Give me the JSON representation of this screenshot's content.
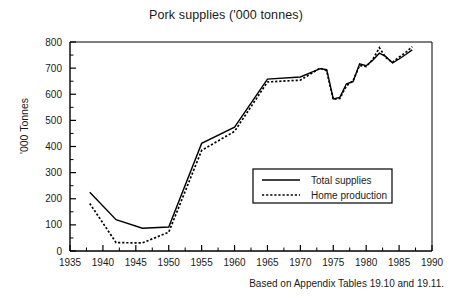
{
  "chart_data": {
    "type": "line",
    "title": "Pork supplies ('000 tonnes)",
    "xlabel": "",
    "ylabel": "'000 Tonnes",
    "xlim": [
      1935,
      1990
    ],
    "ylim": [
      0,
      800
    ],
    "xticks": [
      1935,
      1940,
      1945,
      1950,
      1955,
      1960,
      1965,
      1970,
      1975,
      1980,
      1985,
      1990
    ],
    "yticks": [
      0,
      100,
      200,
      300,
      400,
      500,
      600,
      700,
      800
    ],
    "xtick_labels": [
      "1935",
      "1940",
      "1945",
      "1950",
      "1955",
      "1960",
      "1965",
      "1970",
      "1975",
      "1980",
      "1985",
      "1990"
    ],
    "ytick_labels": [
      "0",
      "100",
      "200",
      "300",
      "400",
      "500",
      "600",
      "700",
      "800"
    ],
    "grid": false,
    "legend_position": "center-right",
    "annotation": "Based on Appendix Tables 19.10 and 19.11.",
    "x": [
      1938,
      1942,
      1946,
      1950,
      1955,
      1960,
      1965,
      1970,
      1973,
      1974,
      1975,
      1976,
      1977,
      1978,
      1979,
      1980,
      1981,
      1982,
      1983,
      1984,
      1985,
      1986,
      1987
    ],
    "series": [
      {
        "name": "Total supplies",
        "style": "solid",
        "color": "#000000",
        "values": [
          225,
          120,
          87,
          92,
          412,
          474,
          658,
          666,
          698,
          694,
          582,
          588,
          640,
          648,
          716,
          709,
          730,
          757,
          744,
          720,
          735,
          752,
          770
        ]
      },
      {
        "name": "Home production",
        "style": "dotted",
        "color": "#000000",
        "values": [
          182,
          32,
          31,
          72,
          385,
          458,
          647,
          654,
          700,
          690,
          580,
          584,
          632,
          652,
          710,
          706,
          733,
          778,
          740,
          722,
          742,
          760,
          782
        ]
      }
    ]
  },
  "legend": {
    "items": [
      {
        "label": "Total supplies",
        "style": "solid"
      },
      {
        "label": "Home production",
        "style": "dotted"
      }
    ]
  },
  "footer": {
    "note": "Based on Appendix Tables 19.10 and 19.11."
  }
}
